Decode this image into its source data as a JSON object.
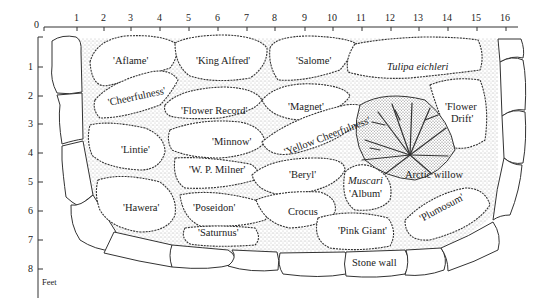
{
  "diagram": {
    "type": "garden-bed-planting-plan",
    "units_label": "Feet",
    "x_axis": {
      "ticks": [
        "0",
        "1",
        "2",
        "3",
        "4",
        "5",
        "6",
        "7",
        "8",
        "9",
        "10",
        "11",
        "12",
        "13",
        "14",
        "15",
        "16"
      ]
    },
    "y_axis": {
      "ticks": [
        "1",
        "2",
        "3",
        "4",
        "5",
        "6",
        "7",
        "8"
      ]
    },
    "plantings": [
      {
        "label": "'Aflame'",
        "italic": false
      },
      {
        "label": "'King Alfred'",
        "italic": false
      },
      {
        "label": "'Salome'",
        "italic": false
      },
      {
        "label": "Tulipa eichleri",
        "italic": true
      },
      {
        "label": "'Cheerfulness'",
        "italic": false
      },
      {
        "label": "'Flower Record'",
        "italic": false
      },
      {
        "label": "'Magnet'",
        "italic": false
      },
      {
        "label": "'Flower",
        "italic": false
      },
      {
        "label": "Drift'",
        "italic": false
      },
      {
        "label": "'Lintie'",
        "italic": false
      },
      {
        "label": "'Minnow'",
        "italic": false
      },
      {
        "label": "'Yellow Cheerfulness'",
        "italic": false
      },
      {
        "label": "'W. P. Milner'",
        "italic": false
      },
      {
        "label": "'Beryl'",
        "italic": false
      },
      {
        "label": "Muscari",
        "italic": true
      },
      {
        "label": "'Album'",
        "italic": false
      },
      {
        "label": "Arctic willow",
        "italic": false
      },
      {
        "label": "'Hawera'",
        "italic": false
      },
      {
        "label": "'Poseidon'",
        "italic": false
      },
      {
        "label": "Crocus",
        "italic": false
      },
      {
        "label": "'Plumosum'",
        "italic": false
      },
      {
        "label": "'Saturnus'",
        "italic": false
      },
      {
        "label": "'Pink Giant'",
        "italic": false
      },
      {
        "label": "Stone wall",
        "italic": false
      }
    ]
  }
}
